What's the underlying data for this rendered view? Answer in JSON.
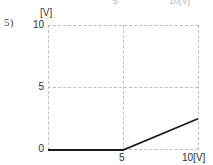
{
  "problem": {
    "number_label": "5)"
  },
  "clipped_above": {
    "x_tick_mid": "5",
    "x_tick_max": "10[V]"
  },
  "axes": {
    "y_unit_label": "[V]",
    "x_unit_label": "[V]",
    "y_ticks": [
      "10",
      "5",
      "0"
    ],
    "x_tick_mid": "5",
    "x_tick_max": "10",
    "x_tick_max_with_unit": "10[V]"
  },
  "colors": {
    "grid": "#bdbdc2",
    "series": "#1d1d1d",
    "text": "#2e2e2e",
    "muted_text": "#b9b9bd",
    "background": "#ffffff"
  },
  "chart_data": {
    "type": "line",
    "title": "",
    "xlabel": "[V]",
    "ylabel": "[V]",
    "xlim": [
      0,
      10
    ],
    "ylim": [
      0,
      10
    ],
    "xticks": [
      5,
      10
    ],
    "yticks": [
      0,
      5,
      10
    ],
    "xticklabels": [
      "5",
      "10[V]"
    ],
    "yticklabels": [
      "0",
      "5",
      "10"
    ],
    "grid": true,
    "grid_style": "dashed",
    "legend": "none",
    "series": [
      {
        "name": "output voltage",
        "x": [
          0,
          5,
          10
        ],
        "y": [
          0,
          0,
          2.5
        ]
      }
    ]
  }
}
